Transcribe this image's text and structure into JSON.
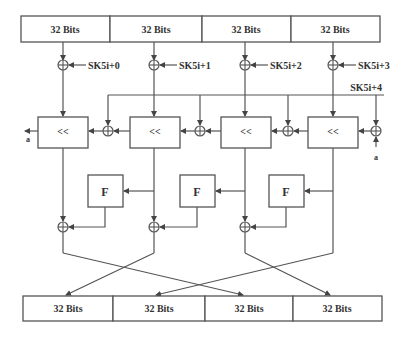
{
  "diagram": {
    "type": "block-cipher-round",
    "input_blocks": [
      "32 Bits",
      "32 Bits",
      "32 Bits",
      "32 Bits"
    ],
    "output_blocks": [
      "32 Bits",
      "32 Bits",
      "32 Bits",
      "32 Bits"
    ],
    "subkeys": [
      "SK5i+0",
      "SK5i+1",
      "SK5i+2",
      "SK5i+3",
      "SK5i+4"
    ],
    "shift_label": "<<",
    "function_label": "F",
    "feedback_out_label": "a",
    "feedback_in_label": "a",
    "colors": {
      "line": "#555555",
      "text": "#333333",
      "background": "#ffffff"
    }
  }
}
